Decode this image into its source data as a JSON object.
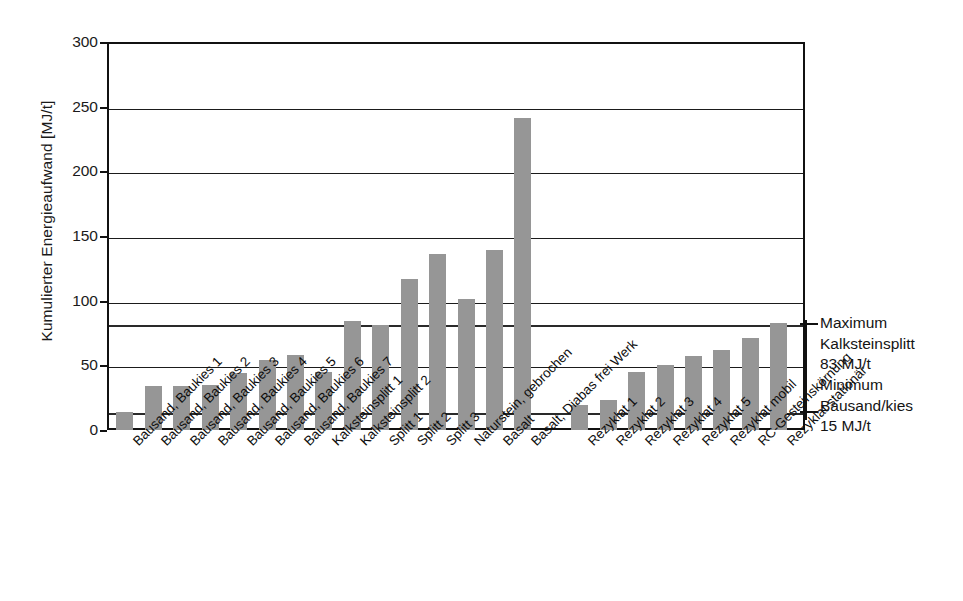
{
  "chart_data": {
    "type": "bar",
    "title": "",
    "xlabel": "",
    "ylabel": "Kumulierter Energieaufwand [MJ/t]",
    "ylim": [
      0,
      300
    ],
    "yticks": [
      0,
      50,
      100,
      150,
      200,
      250,
      300
    ],
    "ytick_labels": [
      "0",
      "50",
      "100",
      "150",
      "200",
      "250",
      "300"
    ],
    "grid": true,
    "legend": "none",
    "bar_color": "#969696",
    "axis_color": "#111111",
    "categories": [
      "Bausand, Baukies 1",
      "Bausand, Baukies 2",
      "Bausand, Baukies 3",
      "Bausand, Baukies 4",
      "Bausand, Baukies 5",
      "Bausand, Baukies 6",
      "Bausand, Baukies 7",
      "Kalksteinsplitt 1",
      "Kalksteinsplitt 2",
      "Splitt 1",
      "Splitt 2",
      "Splitt 3",
      "Naturstein, gebrochen",
      "Basalt",
      "Basalt, Diabas frei Werk",
      "Rezyklat 1",
      "Rezyklat 2",
      "Rezyklat 3",
      "Rezyklat 4",
      "Rezyklat 5",
      "Rezyklat mobil",
      "RC-Gesteinskörnung",
      "Rezyklat stationär"
    ],
    "values": [
      14,
      34,
      34,
      35,
      44,
      54,
      58,
      45,
      84,
      81,
      117,
      136,
      101,
      139,
      241,
      19,
      23,
      45,
      50,
      57,
      62,
      71,
      83
    ],
    "group_gap_after_index": 14,
    "reference_lines": [
      {
        "value": 83,
        "label_lines": [
          "Maximum",
          "Kalksteinsplitt",
          "83 MJ/t"
        ]
      },
      {
        "value": 15,
        "label_lines": [
          "Minimum",
          "Bausand/kies",
          "15 MJ/t"
        ]
      }
    ]
  },
  "annotations": {
    "maximum": {
      "line1": "Maximum",
      "line2": "Kalksteinsplitt",
      "line3": "83 MJ/t"
    },
    "minimum": {
      "line1": "Minimum",
      "line2": "Bausand/kies",
      "line3": "15 MJ/t"
    }
  }
}
